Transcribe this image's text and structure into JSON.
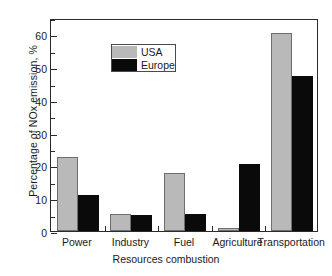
{
  "chart_data": {
    "type": "bar",
    "title": "",
    "xlabel": "Resources combustion",
    "ylabel": "Percentage of NOx emission, %",
    "categories": [
      "Power",
      "Industry",
      "Fuel",
      "Agriculture",
      "Transportation"
    ],
    "series": [
      {
        "name": "USA",
        "color": "#b9b9b9",
        "values": [
          22.5,
          5.2,
          17.8,
          0.8,
          60.5
        ]
      },
      {
        "name": "Europe",
        "color": "#0a0a0a",
        "values": [
          11.0,
          5.0,
          5.2,
          20.5,
          47.3
        ]
      }
    ],
    "ylim": [
      0,
      65
    ],
    "yticks": [
      0,
      10,
      20,
      30,
      40,
      50,
      60
    ],
    "ytick_labels": [
      "0",
      "10",
      "20",
      "30",
      "40",
      "50",
      "60"
    ],
    "yminor_ticks": [
      5,
      15,
      25,
      35,
      45,
      55,
      65
    ],
    "grid": false,
    "legend_position": "upper left",
    "legend_entries": [
      "USA",
      "Europe"
    ]
  },
  "figure": {
    "background": "#ffffff",
    "axis_color": "#2b2b2b"
  }
}
